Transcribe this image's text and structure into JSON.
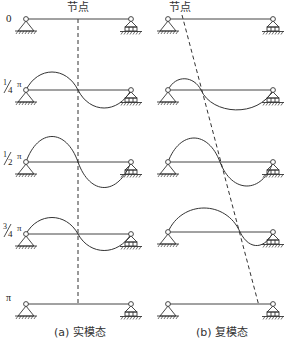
{
  "figure": {
    "node_label_left": "节点",
    "node_label_right": "节点",
    "phase_labels": [
      {
        "id": "phase-0",
        "text": "0"
      },
      {
        "id": "phase-quarter",
        "num": "1",
        "den": "4",
        "pi": "π"
      },
      {
        "id": "phase-half",
        "num": "1",
        "den": "2",
        "pi": "π"
      },
      {
        "id": "phase-three-quarter",
        "num": "3",
        "den": "4",
        "pi": "π"
      },
      {
        "id": "phase-pi",
        "text": "π"
      }
    ],
    "captions": {
      "left": "(a) 实模态",
      "right": "(b) 复模态"
    }
  },
  "icons": {
    "pin_support": "pin-support-icon",
    "roller_support": "roller-support-icon",
    "hinge": "hinge-icon"
  }
}
